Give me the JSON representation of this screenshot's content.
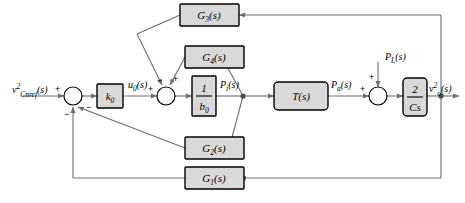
{
  "diagram": {
    "type": "block-diagram",
    "colors": {
      "line": "#6e6e6e",
      "block_border": "#000000",
      "block_fill": "#d9d9d9",
      "text": "#000000",
      "background": "#ffffff"
    },
    "signals": {
      "input": {
        "base": "v",
        "sub": "Cnref",
        "sup": "2",
        "arg": "(s)",
        "full": "v²Cnref(s)"
      },
      "u0": {
        "base": "u",
        "sub": "0",
        "arg": "(s)",
        "full": "u0(s)"
      },
      "pi": {
        "base": "P",
        "sub": "i",
        "arg": "(s)",
        "full": "Pi(s)"
      },
      "pa": {
        "base": "P",
        "sub": "a",
        "arg": "(s)",
        "full": "Pa(s)"
      },
      "pl": {
        "base": "P",
        "sub": "L",
        "arg": "(s)",
        "full": "PL(s)"
      },
      "output": {
        "base": "v",
        "sub": "o",
        "sup": "2",
        "arg": "(s)",
        "full": "v²o(s)"
      }
    },
    "blocks": [
      {
        "id": "k0",
        "base": "k",
        "sub": "0",
        "arg": "",
        "full": "k0"
      },
      {
        "id": "g3",
        "base": "G",
        "sub": "3",
        "arg": "(s)",
        "full": "G3(s)"
      },
      {
        "id": "g4",
        "base": "G",
        "sub": "4",
        "arg": "(s)",
        "full": "G4(s)"
      },
      {
        "id": "g2",
        "base": "G",
        "sub": "2",
        "arg": "(s)",
        "full": "G2(s)"
      },
      {
        "id": "g1",
        "base": "G",
        "sub": "1",
        "arg": "(s)",
        "full": "G1(s)"
      },
      {
        "id": "ts",
        "base": "T",
        "sub": "",
        "arg": "(s)",
        "full": "T(s)"
      },
      {
        "id": "invb0",
        "numerator": "1",
        "denominator_base": "b",
        "denominator_sub": "0",
        "full": "1/b0"
      },
      {
        "id": "twocs",
        "numerator": "2",
        "denominator_base": "Cs",
        "denominator_sub": "",
        "full": "2/Cs"
      }
    ],
    "summing_junctions": [
      {
        "id": "sum1",
        "signs": {
          "left": "+",
          "bottom_left": "−",
          "bottom_right": "−"
        }
      },
      {
        "id": "sum2",
        "signs": {
          "left": "+",
          "top_left": "−",
          "top_right": "+"
        }
      },
      {
        "id": "sum3",
        "signs": {
          "left": "+",
          "top": "+"
        }
      }
    ]
  }
}
